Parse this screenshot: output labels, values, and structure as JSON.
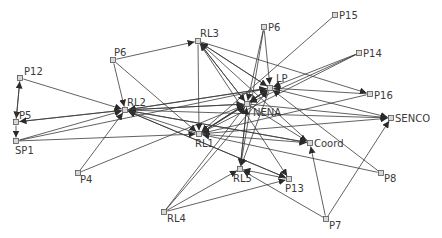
{
  "diagram": {
    "type": "directed-network",
    "colors": {
      "edge": "#3a3a3a",
      "node_fill": "#d8d8d8",
      "node_stroke": "#555555",
      "label": "#3a3a3a",
      "background": "#ffffff"
    },
    "nodes": [
      {
        "id": "P12",
        "label": "P12",
        "x": 20,
        "y": 78,
        "lx": 4,
        "ly": -3
      },
      {
        "id": "P5",
        "label": "P5",
        "x": 16,
        "y": 122,
        "lx": 3,
        "ly": -3
      },
      {
        "id": "SP1",
        "label": "SP1",
        "x": 16,
        "y": 141,
        "lx": -1,
        "ly": 13
      },
      {
        "id": "P4",
        "label": "P4",
        "x": 78,
        "y": 173,
        "lx": 2,
        "ly": 10
      },
      {
        "id": "P6a",
        "label": "P6",
        "x": 113,
        "y": 60,
        "lx": 1,
        "ly": -4
      },
      {
        "id": "RL2",
        "label": "RL2",
        "x": 125,
        "y": 110,
        "lx": 2,
        "ly": -4
      },
      {
        "id": "RL3",
        "label": "RL3",
        "x": 198,
        "y": 41,
        "lx": 2,
        "ly": -4
      },
      {
        "id": "P6b",
        "label": "P6",
        "x": 264,
        "y": 27,
        "lx": 4,
        "ly": 4
      },
      {
        "id": "P15",
        "label": "P15",
        "x": 335,
        "y": 15,
        "lx": 4,
        "ly": 4
      },
      {
        "id": "P14",
        "label": "P14",
        "x": 359,
        "y": 53,
        "lx": 4,
        "ly": 4
      },
      {
        "id": "LP",
        "label": "LP",
        "x": 270,
        "y": 88,
        "lx": 6,
        "ly": -6
      },
      {
        "id": "NENA",
        "label": "NENA",
        "x": 247,
        "y": 104,
        "lx": 6,
        "ly": 12
      },
      {
        "id": "RL1",
        "label": "RL1",
        "x": 199,
        "y": 134,
        "lx": -4,
        "ly": 13
      },
      {
        "id": "Coord",
        "label": "Coord",
        "x": 310,
        "y": 143,
        "lx": 4,
        "ly": 4
      },
      {
        "id": "P16",
        "label": "P16",
        "x": 370,
        "y": 94,
        "lx": 4,
        "ly": 5
      },
      {
        "id": "SENCO",
        "label": "SENCO",
        "x": 391,
        "y": 118,
        "lx": 4,
        "ly": 4
      },
      {
        "id": "P8",
        "label": "P8",
        "x": 381,
        "y": 173,
        "lx": 3,
        "ly": 9
      },
      {
        "id": "P13",
        "label": "P13",
        "x": 289,
        "y": 179,
        "lx": -4,
        "ly": 13
      },
      {
        "id": "RL5",
        "label": "RL5",
        "x": 240,
        "y": 169,
        "lx": -7,
        "ly": 13
      },
      {
        "id": "RL4",
        "label": "RL4",
        "x": 164,
        "y": 212,
        "lx": 3,
        "ly": 10
      },
      {
        "id": "P7",
        "label": "P7",
        "x": 326,
        "y": 219,
        "lx": 3,
        "ly": 10
      }
    ],
    "edges": [
      {
        "from": "P12",
        "to": "P5"
      },
      {
        "from": "P5",
        "to": "P12"
      },
      {
        "from": "P5",
        "to": "SP1"
      },
      {
        "from": "P12",
        "to": "RL2"
      },
      {
        "from": "P5",
        "to": "RL2"
      },
      {
        "from": "SP1",
        "to": "RL2"
      },
      {
        "from": "SP1",
        "to": "RL1"
      },
      {
        "from": "SP1",
        "to": "LP"
      },
      {
        "from": "P4",
        "to": "RL2"
      },
      {
        "from": "P4",
        "to": "NENA"
      },
      {
        "from": "RL2",
        "to": "P5"
      },
      {
        "from": "P6a",
        "to": "RL3"
      },
      {
        "from": "P6a",
        "to": "RL2"
      },
      {
        "from": "P6a",
        "to": "RL1"
      },
      {
        "from": "RL3",
        "to": "RL1"
      },
      {
        "from": "RL3",
        "to": "P16"
      },
      {
        "from": "NENA",
        "to": "RL3"
      },
      {
        "from": "LP",
        "to": "RL3"
      },
      {
        "from": "Coord",
        "to": "RL3"
      },
      {
        "from": "SENCO",
        "to": "RL2"
      },
      {
        "from": "LP",
        "to": "RL2"
      },
      {
        "from": "NENA",
        "to": "RL2"
      },
      {
        "from": "Coord",
        "to": "RL2"
      },
      {
        "from": "P13",
        "to": "RL2"
      },
      {
        "from": "RL1",
        "to": "RL2"
      },
      {
        "from": "P6b",
        "to": "LP"
      },
      {
        "from": "P6b",
        "to": "NENA"
      },
      {
        "from": "P6b",
        "to": "RL5"
      },
      {
        "from": "P15",
        "to": "RL1"
      },
      {
        "from": "P14",
        "to": "LP"
      },
      {
        "from": "P14",
        "to": "NENA"
      },
      {
        "from": "P14",
        "to": "RL1"
      },
      {
        "from": "P16",
        "to": "LP"
      },
      {
        "from": "P16",
        "to": "RL1"
      },
      {
        "from": "LP",
        "to": "SENCO"
      },
      {
        "from": "NENA",
        "to": "SENCO"
      },
      {
        "from": "RL1",
        "to": "SENCO"
      },
      {
        "from": "P7",
        "to": "SENCO"
      },
      {
        "from": "P7",
        "to": "Coord"
      },
      {
        "from": "P7",
        "to": "RL5"
      },
      {
        "from": "P8",
        "to": "LP"
      },
      {
        "from": "P8",
        "to": "RL1"
      },
      {
        "from": "RL1",
        "to": "Coord"
      },
      {
        "from": "NENA",
        "to": "Coord"
      },
      {
        "from": "RL2",
        "to": "Coord"
      },
      {
        "from": "LP",
        "to": "RL1"
      },
      {
        "from": "NENA",
        "to": "RL1"
      },
      {
        "from": "RL1",
        "to": "LP"
      },
      {
        "from": "RL1",
        "to": "NENA"
      },
      {
        "from": "RL2",
        "to": "LP"
      },
      {
        "from": "RL2",
        "to": "NENA"
      },
      {
        "from": "RL3",
        "to": "NENA"
      },
      {
        "from": "RL3",
        "to": "LP"
      },
      {
        "from": "RL3",
        "to": "P13"
      },
      {
        "from": "NENA",
        "to": "RL5"
      },
      {
        "from": "LP",
        "to": "RL5"
      },
      {
        "from": "P13",
        "to": "RL5"
      },
      {
        "from": "RL4",
        "to": "RL5"
      },
      {
        "from": "RL4",
        "to": "P13"
      },
      {
        "from": "RL4",
        "to": "LP"
      },
      {
        "from": "RL4",
        "to": "NENA"
      },
      {
        "from": "RL2",
        "to": "P13"
      },
      {
        "from": "NENA",
        "to": "LP"
      },
      {
        "from": "LP",
        "to": "NENA"
      },
      {
        "from": "RL5",
        "to": "NENA"
      }
    ]
  }
}
